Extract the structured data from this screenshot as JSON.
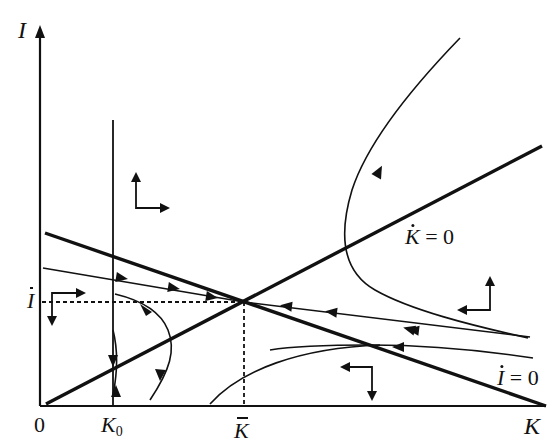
{
  "diagram": {
    "type": "phase-diagram",
    "axes": {
      "y_label": "I",
      "x_label": "K",
      "origin_label": "0"
    },
    "ticks": {
      "k0_label": "K",
      "k0_subscript": "0",
      "kbar_label": "K",
      "ibar_label": "I"
    },
    "nullclines": {
      "kdot": {
        "label_var": "K",
        "label_eq": " = 0",
        "description": "K-dot = 0, upward sloping line from origin"
      },
      "idot": {
        "label_var": "I",
        "label_eq": " = 0",
        "description": "I-dot = 0, downward sloping line"
      }
    },
    "equilibrium": {
      "label": "(K̄, Ī)",
      "description": "saddle point at intersection of nullclines"
    },
    "colors": {
      "line": "#111111",
      "background": "#ffffff"
    },
    "direction_arrows": [
      {
        "region": "upper-left",
        "directions": "up, right"
      },
      {
        "region": "left-below-ibar",
        "directions": "right, down"
      },
      {
        "region": "right-above",
        "directions": "left, up"
      },
      {
        "region": "bottom-right",
        "directions": "left, down"
      }
    ]
  }
}
